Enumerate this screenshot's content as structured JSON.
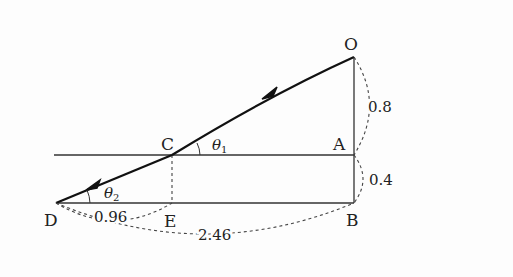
{
  "diagram": {
    "points": {
      "O": "O",
      "A": "A",
      "B": "B",
      "C": "C",
      "D": "D",
      "E": "E"
    },
    "angles": {
      "theta1": {
        "symbol": "θ",
        "subscript": "1"
      },
      "theta2": {
        "symbol": "θ",
        "subscript": "2"
      }
    },
    "dimensions": {
      "OA": "0.8",
      "AB": "0.4",
      "DE": "0.96",
      "DB": "2.46"
    },
    "colors": {
      "line": "#222222",
      "dashed": "#444444",
      "background": "#fdfdfd"
    }
  }
}
